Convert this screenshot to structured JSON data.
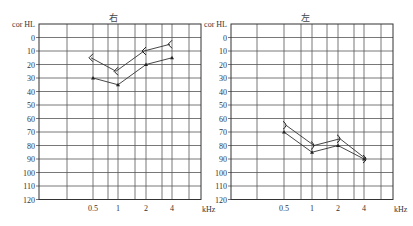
{
  "chart_data": [
    {
      "type": "line",
      "title": "右",
      "ylabel": "cor HL",
      "xlabel": "kHz",
      "x_tick_labels": [
        "0.5",
        "1",
        "2",
        "4"
      ],
      "y_ticks": [
        0,
        10,
        20,
        30,
        40,
        50,
        60,
        70,
        80,
        90,
        100,
        110,
        120
      ],
      "ylim": [
        120,
        -10
      ],
      "grid": true,
      "x": [
        0.5,
        1,
        2,
        4
      ],
      "series": [
        {
          "name": "bracket-symbol series",
          "symbol": "<",
          "values": [
            15,
            25,
            10,
            5
          ]
        },
        {
          "name": "triangle-marker series",
          "symbol": "triangle",
          "values": [
            30,
            35,
            20,
            15
          ]
        }
      ]
    },
    {
      "type": "line",
      "title": "左",
      "ylabel": "cor HL",
      "xlabel": "kHz",
      "x_tick_labels": [
        "0.5",
        "1",
        "2",
        "4"
      ],
      "y_ticks": [
        0,
        10,
        20,
        30,
        40,
        50,
        60,
        70,
        80,
        90,
        100,
        110,
        120
      ],
      "ylim": [
        120,
        -10
      ],
      "grid": true,
      "x": [
        0.5,
        1,
        2,
        4
      ],
      "series": [
        {
          "name": "bracket-symbol series",
          "symbol": ">",
          "values": [
            65,
            80,
            75,
            90
          ]
        },
        {
          "name": "triangle-marker series",
          "symbol": "triangle",
          "values": [
            70,
            85,
            80,
            90
          ]
        }
      ]
    }
  ],
  "layout": {
    "panels": [
      {
        "frame_left": 39,
        "frame_right": 201,
        "verticals": [
          67,
          93,
          108,
          118,
          135,
          146,
          162,
          172,
          189
        ],
        "freq_x": [
          93,
          118,
          146,
          172
        ],
        "title_x": 113,
        "label_x": 8
      },
      {
        "frame_left": 231,
        "frame_right": 393,
        "verticals": [
          257,
          284,
          301,
          312,
          327,
          338,
          354,
          364,
          381
        ],
        "freq_x": [
          284,
          312,
          338,
          364
        ],
        "title_x": 305,
        "label_x": 203
      }
    ],
    "y_zero": 37.5,
    "px_per_10db": 13.5
  }
}
